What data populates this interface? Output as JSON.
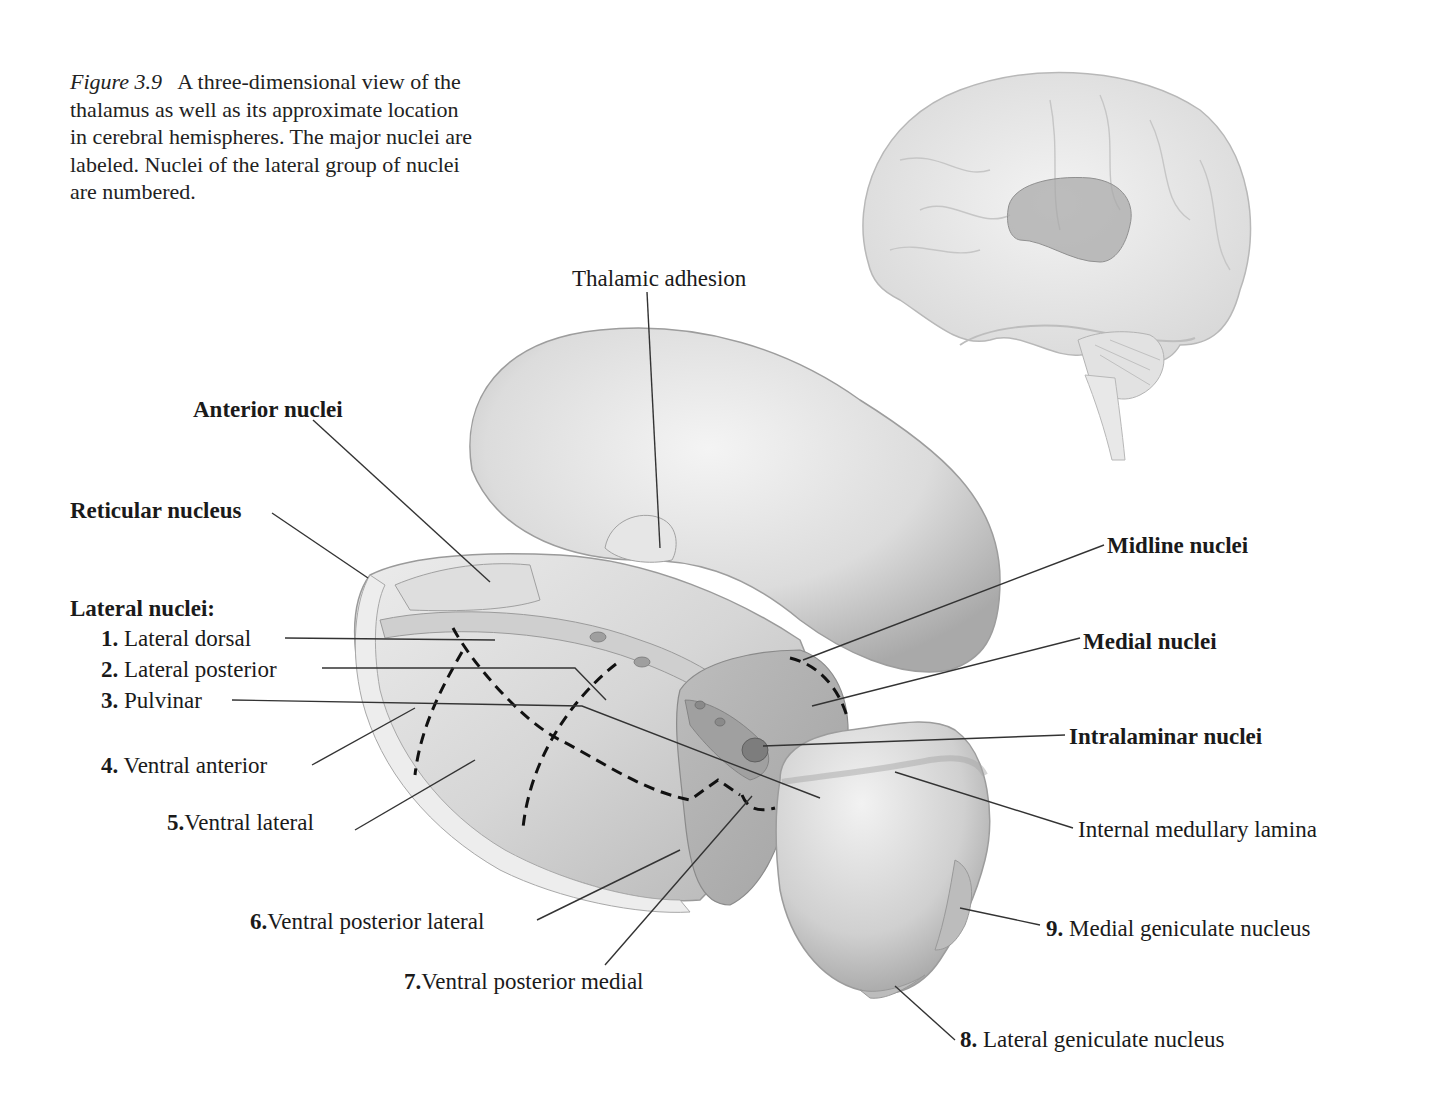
{
  "caption": {
    "figure_label": "Figure 3.9",
    "text": "A three-dimensional view of the thalamus as well as its approximate location in cerebral hemispheres. The major nuclei are labeled. Nuclei of the lateral group of nuclei are numbered."
  },
  "labels": {
    "thalamic_adhesion": "Thalamic adhesion",
    "anterior_nuclei": "Anterior nuclei",
    "reticular_nucleus": "Reticular nucleus",
    "lateral_nuclei_heading": "Lateral nuclei:",
    "midline_nuclei": "Midline nuclei",
    "medial_nuclei": "Medial nuclei",
    "intralaminar_nuclei": "Intralaminar nuclei",
    "internal_medullary_lamina": "Internal medullary lamina"
  },
  "lateral_nuclei": [
    {
      "num": "1.",
      "name": "Lateral dorsal"
    },
    {
      "num": "2.",
      "name": "Lateral posterior"
    },
    {
      "num": "3.",
      "name": "Pulvinar"
    },
    {
      "num": "4.",
      "name": "Ventral anterior"
    },
    {
      "num": "5.",
      "name": "Ventral lateral"
    },
    {
      "num": "6.",
      "name": "Ventral posterior lateral"
    },
    {
      "num": "7.",
      "name": "Ventral posterior medial"
    },
    {
      "num": "8.",
      "name": "Lateral geniculate nucleus"
    },
    {
      "num": "9.",
      "name": "Medial geniculate nucleus"
    }
  ],
  "colors": {
    "background": "#ffffff",
    "structure_light": "#e6e6e6",
    "structure_mid": "#c4c4c4",
    "structure_dark": "#8e8e8e",
    "leader_line": "#333333",
    "dashed_border": "#111111"
  }
}
